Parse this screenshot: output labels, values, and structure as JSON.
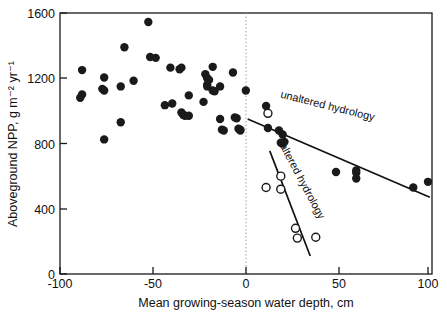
{
  "chart_data": {
    "type": "scatter",
    "title": "",
    "xlabel": "Mean growing-season water depth, cm",
    "ylabel": "Aboveground NPP, g m⁻² yr⁻¹",
    "xlim": [
      -100,
      100
    ],
    "ylim": [
      0,
      1600
    ],
    "xticks": [
      -100,
      -50,
      0,
      50,
      100
    ],
    "xtick_labels": [
      "-100",
      "-50",
      "0",
      "50",
      "100"
    ],
    "yticks": [
      0,
      400,
      800,
      1200,
      1600
    ],
    "ytick_labels": [
      "0",
      "400",
      "800",
      "1200",
      "1600"
    ],
    "grid": false,
    "legend_position": "inline-annotations",
    "annotations": [
      {
        "text": "unaltered hydrology",
        "x": 45,
        "y": 1010,
        "rotation": 14
      },
      {
        "text": "altered hydrology",
        "x": 30,
        "y": 560,
        "rotation": 62
      }
    ],
    "series": [
      {
        "name": "unaltered hydrology",
        "marker": "filled-circle",
        "color": "#1a1a1a",
        "points": [
          [
            -88,
            1250
          ],
          [
            -88,
            1100
          ],
          [
            -89,
            1080
          ],
          [
            -76,
            1205
          ],
          [
            -77,
            1135
          ],
          [
            -76,
            1125
          ],
          [
            -76,
            825
          ],
          [
            -67,
            1150
          ],
          [
            -67,
            930
          ],
          [
            -65,
            1390
          ],
          [
            -60,
            1185
          ],
          [
            -52,
            1545
          ],
          [
            -51,
            1330
          ],
          [
            -48,
            1325
          ],
          [
            -43,
            1035
          ],
          [
            -40,
            1265
          ],
          [
            -39,
            1045
          ],
          [
            -35,
            1255
          ],
          [
            -34,
            1265
          ],
          [
            -34,
            990
          ],
          [
            -33,
            975
          ],
          [
            -32,
            970
          ],
          [
            -30,
            1095
          ],
          [
            -30,
            970
          ],
          [
            -22,
            1055
          ],
          [
            -21,
            1225
          ],
          [
            -20,
            1200
          ],
          [
            -20,
            1160
          ],
          [
            -20,
            1150
          ],
          [
            -19,
            1190
          ],
          [
            -17,
            1270
          ],
          [
            -17,
            1125
          ],
          [
            -16,
            1120
          ],
          [
            -13,
            950
          ],
          [
            -13,
            1150
          ],
          [
            -12,
            885
          ],
          [
            -11,
            880
          ],
          [
            -6,
            1235
          ],
          [
            -5,
            960
          ],
          [
            -4,
            955
          ],
          [
            -3,
            890
          ],
          [
            -2,
            880
          ],
          [
            -2,
            885
          ],
          [
            1,
            1125
          ],
          [
            12,
            1030
          ],
          [
            13,
            895
          ],
          [
            19,
            880
          ],
          [
            21,
            855
          ],
          [
            20,
            805
          ],
          [
            21,
            800
          ],
          [
            22,
            810
          ],
          [
            50,
            625
          ],
          [
            61,
            635
          ],
          [
            61,
            620
          ],
          [
            61,
            585
          ],
          [
            92,
            530
          ],
          [
            100,
            565
          ]
        ]
      },
      {
        "name": "altered hydrology",
        "marker": "open-circle",
        "color": "#ffffff",
        "points": [
          [
            13,
            985
          ],
          [
            12,
            530
          ],
          [
            20,
            600
          ],
          [
            20,
            520
          ],
          [
            28,
            280
          ],
          [
            29,
            220
          ],
          [
            39,
            225
          ]
        ]
      }
    ],
    "fit_lines": [
      {
        "name": "unaltered hydrology",
        "x1": 2,
        "y1": 950,
        "x2": 101,
        "y2": 470
      },
      {
        "name": "altered hydrology",
        "x1": 14,
        "y1": 755,
        "x2": 36,
        "y2": 110
      }
    ]
  }
}
